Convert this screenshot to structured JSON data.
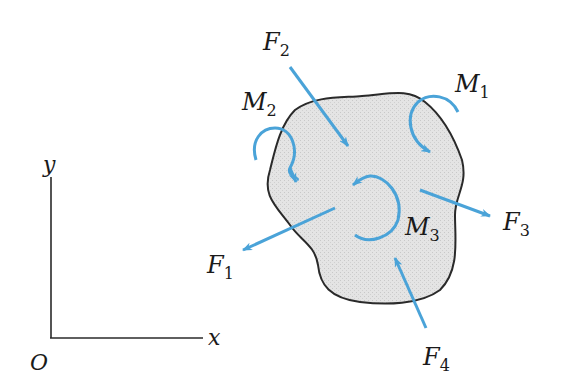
{
  "diagram": {
    "type": "free-body diagram",
    "colors": {
      "force": "#4aa3d8",
      "outline": "#2a2a2a",
      "body_fill": "#e6e6e6",
      "axes": "#2a2a2a",
      "text": "#1a1a1a"
    },
    "axes": {
      "origin_label": "O",
      "x_label": "x",
      "y_label": "y"
    },
    "forces": [
      {
        "id": "F1",
        "name": "F",
        "sub": "1"
      },
      {
        "id": "F2",
        "name": "F",
        "sub": "2"
      },
      {
        "id": "F3",
        "name": "F",
        "sub": "3"
      },
      {
        "id": "F4",
        "name": "F",
        "sub": "4"
      }
    ],
    "moments": [
      {
        "id": "M1",
        "name": "M",
        "sub": "1"
      },
      {
        "id": "M2",
        "name": "M",
        "sub": "2"
      },
      {
        "id": "M3",
        "name": "M",
        "sub": "3"
      }
    ]
  }
}
